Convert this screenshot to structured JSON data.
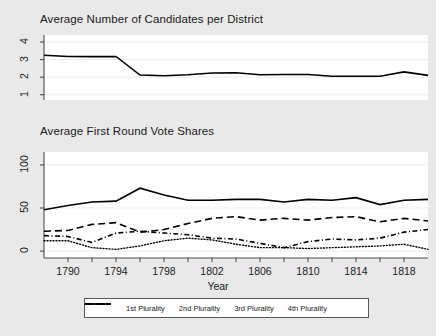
{
  "figure": {
    "background_color": "#e9e9e9",
    "plot_background_color": "#ffffff",
    "axis_color": "#4d4d4d",
    "line_color": "#000000"
  },
  "axis_title": "Year",
  "legend": {
    "items": [
      {
        "label": "1st Plurality",
        "style": "solid"
      },
      {
        "label": "2nd Plurality",
        "style": "dashed"
      },
      {
        "label": "3rd Plurality",
        "style": "dash-dot"
      },
      {
        "label": "4th Plurality",
        "style": "dotted"
      }
    ]
  },
  "chart_data": [
    {
      "type": "line",
      "title": "Average Number of Candidates per District",
      "xlabel": "Year",
      "ylabel": "",
      "xlim": [
        1788,
        1820
      ],
      "ylim": [
        0.7,
        4.4
      ],
      "yticks": [
        1,
        2,
        3,
        4
      ],
      "ytick_labels": [
        "1",
        "2",
        "3",
        "4"
      ],
      "xticks": [
        1790,
        1792,
        1794,
        1796,
        1798,
        1800,
        1802,
        1804,
        1806,
        1808,
        1810,
        1812,
        1814,
        1816,
        1818
      ],
      "xtick_labels": [
        "1790",
        "",
        "1794",
        "",
        "1798",
        "",
        "1802",
        "",
        "1806",
        "",
        "1810",
        "",
        "1814",
        "",
        "1818"
      ],
      "grid": true,
      "series": [
        {
          "name": "Average Number of Candidates",
          "style": "solid",
          "x": [
            1788,
            1790,
            1792,
            1794,
            1796,
            1798,
            1800,
            1802,
            1804,
            1806,
            1808,
            1810,
            1812,
            1814,
            1816,
            1818,
            1820
          ],
          "values": [
            3.25,
            3.18,
            3.17,
            3.18,
            2.12,
            2.08,
            2.14,
            2.24,
            2.25,
            2.14,
            2.15,
            2.15,
            2.05,
            2.05,
            2.05,
            2.3,
            2.1
          ]
        }
      ]
    },
    {
      "type": "line",
      "title": "Average First Round Vote Shares",
      "xlabel": "Year",
      "ylabel": "",
      "xlim": [
        1788,
        1820
      ],
      "ylim": [
        -8,
        115
      ],
      "yticks": [
        0,
        50,
        100
      ],
      "ytick_labels": [
        "0",
        "50",
        "100"
      ],
      "xticks": [
        1790,
        1792,
        1794,
        1796,
        1798,
        1800,
        1802,
        1804,
        1806,
        1808,
        1810,
        1812,
        1814,
        1816,
        1818
      ],
      "xtick_labels": [
        "1790",
        "",
        "1794",
        "",
        "1798",
        "",
        "1802",
        "",
        "1806",
        "",
        "1810",
        "",
        "1814",
        "",
        "1818"
      ],
      "grid": true,
      "x": [
        1788,
        1790,
        1792,
        1794,
        1796,
        1798,
        1800,
        1802,
        1804,
        1806,
        1808,
        1810,
        1812,
        1814,
        1816,
        1818,
        1820
      ],
      "series": [
        {
          "name": "1st Plurality",
          "style": "solid",
          "values": [
            48,
            53,
            57,
            58,
            73,
            65,
            59,
            59,
            60,
            60,
            57,
            60,
            59,
            62,
            54,
            59,
            60
          ]
        },
        {
          "name": "2nd Plurality",
          "style": "dashed",
          "values": [
            23,
            24,
            31,
            33,
            22,
            25,
            32,
            38,
            40,
            36,
            38,
            36,
            39,
            40,
            34,
            38,
            35
          ]
        },
        {
          "name": "3rd Plurality",
          "style": "dash-dot",
          "values": [
            18,
            17,
            10,
            21,
            23,
            21,
            19,
            15,
            14,
            9,
            4,
            11,
            14,
            13,
            15,
            22,
            25
          ]
        },
        {
          "name": "4th Plurality",
          "style": "dotted",
          "values": [
            12,
            12,
            4,
            2,
            6,
            12,
            15,
            13,
            8,
            4,
            4,
            3,
            4,
            5,
            6,
            8,
            2
          ]
        }
      ]
    }
  ]
}
